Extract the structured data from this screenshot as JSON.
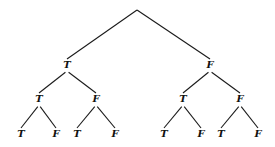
{
  "diagram": {
    "type": "binary-tree",
    "root": {
      "label": "",
      "x": 137,
      "y": 10
    },
    "nodes": [
      {
        "id": "l1a",
        "label": "T",
        "x": 67,
        "y": 68,
        "parent": "root"
      },
      {
        "id": "l1b",
        "label": "F",
        "x": 210,
        "y": 68,
        "parent": "root"
      },
      {
        "id": "l2a",
        "label": "T",
        "x": 39,
        "y": 102,
        "parent": "l1a"
      },
      {
        "id": "l2b",
        "label": "F",
        "x": 96,
        "y": 102,
        "parent": "l1a"
      },
      {
        "id": "l2c",
        "label": "T",
        "x": 183,
        "y": 102,
        "parent": "l1b"
      },
      {
        "id": "l2d",
        "label": "F",
        "x": 240,
        "y": 102,
        "parent": "l1b"
      },
      {
        "id": "l3a",
        "label": "T",
        "x": 21,
        "y": 137,
        "parent": "l2a"
      },
      {
        "id": "l3b",
        "label": "F",
        "x": 56,
        "y": 137,
        "parent": "l2a"
      },
      {
        "id": "l3c",
        "label": "T",
        "x": 77,
        "y": 137,
        "parent": "l2b"
      },
      {
        "id": "l3d",
        "label": "F",
        "x": 115,
        "y": 137,
        "parent": "l2b"
      },
      {
        "id": "l3e",
        "label": "T",
        "x": 164,
        "y": 137,
        "parent": "l2c"
      },
      {
        "id": "l3f",
        "label": "F",
        "x": 201,
        "y": 137,
        "parent": "l2c"
      },
      {
        "id": "l3g",
        "label": "T",
        "x": 221,
        "y": 137,
        "parent": "l2d"
      },
      {
        "id": "l3h",
        "label": "F",
        "x": 258,
        "y": 137,
        "parent": "l2d"
      }
    ]
  }
}
